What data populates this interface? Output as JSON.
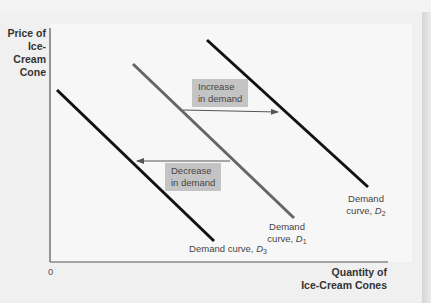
{
  "figure": {
    "y_axis_title_lines": [
      "Price of",
      "Ice-Cream",
      "Cone"
    ],
    "x_axis_title_lines": [
      "Quantity of",
      "Ice-Cream Cones"
    ],
    "origin_label": "0",
    "shift_labels": {
      "increase": [
        "Increase",
        "in demand"
      ],
      "decrease": [
        "Decrease",
        "in demand"
      ]
    },
    "curves": [
      {
        "id": "D1",
        "label_prefix": "Demand",
        "label_line2": "curve,",
        "symbol": "D",
        "subscript": "1",
        "color": "#666666"
      },
      {
        "id": "D2",
        "label_prefix": "Demand",
        "label_line2": "curve,",
        "symbol": "D",
        "subscript": "2",
        "color": "#111111"
      },
      {
        "id": "D3",
        "label_prefix": "Demand curve,",
        "symbol": "D",
        "subscript": "3",
        "color": "#111111"
      }
    ],
    "colors": {
      "axis": "#555555",
      "shift_box": "#c4c4c4",
      "arrow": "#555555",
      "background": "#f0f0f0"
    }
  }
}
